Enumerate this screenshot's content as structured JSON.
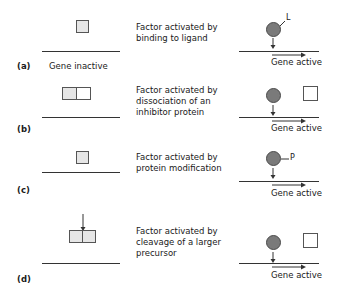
{
  "panels": [
    {
      "letter": "(a)",
      "left_label": "Gene inactive",
      "description_lines": [
        "Factor activated by",
        "binding to ligand"
      ],
      "right_label": "Gene active",
      "modifier": "L"
    },
    {
      "letter": "(b)",
      "description_lines": [
        "Factor activated by",
        "dissociation of an",
        "inhibitor protein"
      ],
      "right_label": "Gene active"
    },
    {
      "letter": "(c)",
      "description_lines": [
        "Factor activated by",
        "protein modification"
      ],
      "right_label": "Gene active",
      "modifier": "P"
    },
    {
      "letter": "(d)",
      "description_lines": [
        "Factor activated by",
        "cleavage of a larger",
        "precursor"
      ],
      "right_label": "Gene active"
    }
  ],
  "colors": {
    "factor_fill": "#e6e6e6",
    "active_circle": "#7a7a7a",
    "line": "#333333"
  }
}
